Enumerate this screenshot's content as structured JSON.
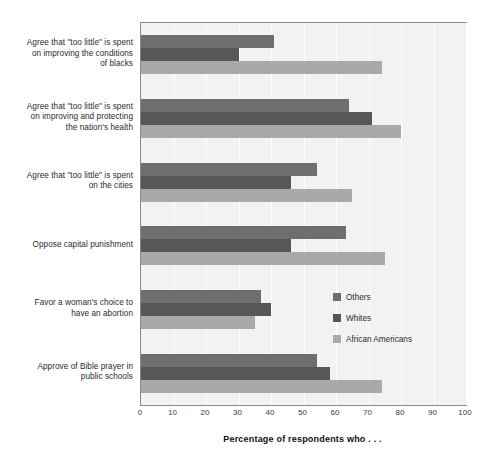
{
  "chart_data": {
    "type": "bar",
    "orientation": "horizontal",
    "title": "",
    "xlabel": "Percentage of respondents who . . .",
    "ylabel": "",
    "xlim": [
      0,
      100
    ],
    "xticks": [
      0,
      10,
      20,
      30,
      40,
      50,
      60,
      70,
      80,
      90,
      100
    ],
    "grid": true,
    "legend_position": "middle-right",
    "categories": [
      "Agree that \"too little\" is spent on improving the conditions of blacks",
      "Agree that \"too little\" is spent on improving and protecting the nation's health",
      "Agree that \"too little\" is spent on the cities",
      "Oppose capital punishment",
      "Favor a woman's choice to have an abortion",
      "Approve of Bible prayer in public schools"
    ],
    "category_lines": [
      [
        "Agree that \"too little\" is spent",
        "on improving the conditions",
        "of blacks"
      ],
      [
        "Agree that \"too little\" is spent",
        "on improving and protecting",
        "the nation's health"
      ],
      [
        "Agree that \"too little\" is spent",
        "on the cities"
      ],
      [
        "Oppose capital punishment"
      ],
      [
        "Favor a woman's choice to",
        "have an abortion"
      ],
      [
        "Approve of Bible prayer in",
        "public schools"
      ]
    ],
    "series": [
      {
        "name": "Others",
        "color": "#6e6e6e",
        "values": [
          41,
          64,
          54,
          63,
          37,
          54
        ]
      },
      {
        "name": "Whites",
        "color": "#575757",
        "values": [
          30,
          71,
          46,
          46,
          40,
          58
        ]
      },
      {
        "name": "African Americans",
        "color": "#a9a9a9",
        "values": [
          74,
          80,
          65,
          75,
          35,
          74
        ]
      }
    ]
  },
  "legend": {
    "items": [
      {
        "label": "Others",
        "swatch": "others"
      },
      {
        "label": "Whites",
        "swatch": "whites"
      },
      {
        "label": "African Americans",
        "swatch": "african"
      }
    ]
  },
  "axis": {
    "x_title": "Percentage of respondents who . . ."
  },
  "colors": {
    "plot_background": "#f2f2f2",
    "grid": "#ffffff",
    "frame": "#8a8a8a",
    "others": "#6e6e6e",
    "whites": "#575757",
    "african_americans": "#a9a9a9"
  }
}
